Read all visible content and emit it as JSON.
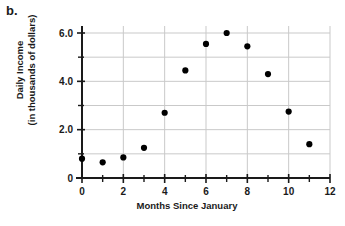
{
  "part_label": "b.",
  "chart_data": {
    "type": "scatter",
    "title": "",
    "xlabel": "Months Since January",
    "ylabel": "Daily Income (in thousands of dollars)",
    "ylabel_lines": [
      "Daily Income",
      "(in thousands of dollars)"
    ],
    "x": [
      0,
      1,
      2,
      3,
      4,
      5,
      6,
      7,
      8,
      9,
      10,
      11
    ],
    "values": [
      0.8,
      0.65,
      0.85,
      1.25,
      2.7,
      4.45,
      5.55,
      6.0,
      5.45,
      4.3,
      2.75,
      1.4
    ],
    "points": [
      {
        "x": 0,
        "y": 0.8
      },
      {
        "x": 1,
        "y": 0.65
      },
      {
        "x": 2,
        "y": 0.85
      },
      {
        "x": 3,
        "y": 1.25
      },
      {
        "x": 4,
        "y": 2.7
      },
      {
        "x": 5,
        "y": 4.45
      },
      {
        "x": 6,
        "y": 5.55
      },
      {
        "x": 7,
        "y": 6.0
      },
      {
        "x": 8,
        "y": 5.45
      },
      {
        "x": 9,
        "y": 4.3
      },
      {
        "x": 10,
        "y": 2.75
      },
      {
        "x": 11,
        "y": 1.4
      }
    ],
    "xlim": [
      0,
      12
    ],
    "ylim": [
      0,
      6.6
    ],
    "xticks": [
      0,
      2,
      4,
      6,
      8,
      10,
      12
    ],
    "xtick_labels": [
      "0",
      "2",
      "4",
      "6",
      "8",
      "10",
      "12"
    ],
    "xticks_minor": [
      1,
      3,
      5,
      7,
      9,
      11
    ],
    "yticks": [
      0,
      2,
      4,
      6
    ],
    "ytick_labels": [
      "0",
      "2.0",
      "4.0",
      "6.0"
    ],
    "yticks_minor": [
      1,
      3,
      5
    ],
    "grid": true,
    "grid_x_values": [
      2,
      4,
      6,
      8,
      10,
      12
    ],
    "grid_y_values": [
      1,
      2,
      3,
      4,
      5,
      6
    ],
    "legend": null,
    "marker_color": "#000000",
    "grid_color": "#c9c9c9",
    "axis_color": "#1a1a1a"
  }
}
